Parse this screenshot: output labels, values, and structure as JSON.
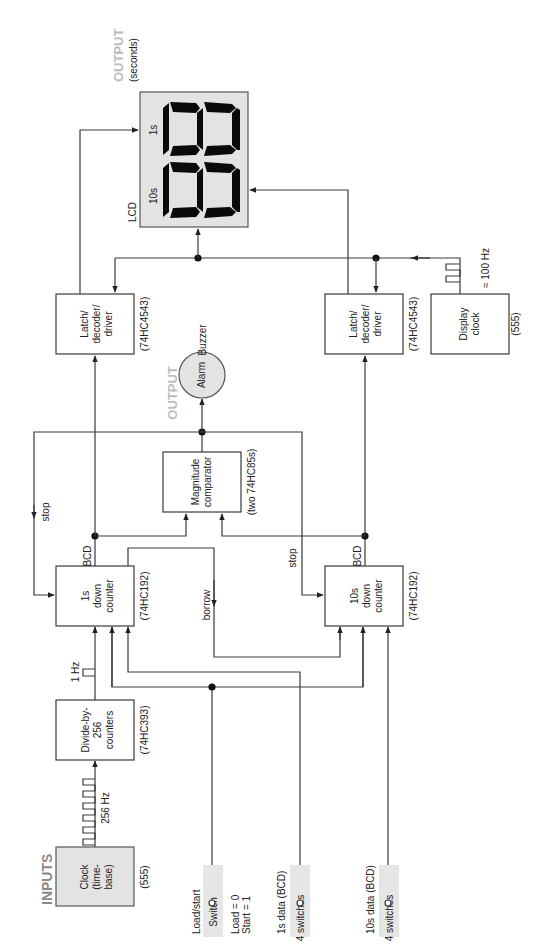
{
  "diagram": {
    "orientation": "rotated 90 degrees counter-clockwise",
    "section_labels": {
      "inputs": "INPUTS",
      "output_display": "OUTPUT",
      "output_display_sub": "(seconds)",
      "output_alarm": "OUTPUT"
    },
    "blocks": {
      "clock": {
        "lines": [
          "Clock",
          "(time-",
          "base)"
        ],
        "part": "(555)"
      },
      "divider": {
        "lines": [
          "Divide-by-",
          "256",
          "counters"
        ],
        "part": "(74HC393)"
      },
      "counter_1s": {
        "lines": [
          "1s",
          "down",
          "counter"
        ],
        "part": "(74HC192)"
      },
      "counter_10s": {
        "lines": [
          "10s",
          "down",
          "counter"
        ],
        "part": "(74HC192)"
      },
      "comparator": {
        "lines": [
          "Magnitude",
          "comparator"
        ],
        "part": "(two 74HC85s)"
      },
      "alarm": {
        "label": "Alarm",
        "sublabel": "Buzzer"
      },
      "latch_1s": {
        "lines": [
          "Latch/",
          "decoder/",
          "driver"
        ],
        "part": "(74HC4543)"
      },
      "latch_10s": {
        "lines": [
          "Latch/",
          "decoder/",
          "driver"
        ],
        "part": "(74HC4543)"
      },
      "display_clock": {
        "lines": [
          "Display",
          "clock"
        ],
        "part": "(555)"
      },
      "lcd": {
        "label": "LCD",
        "digit_10s": "10s",
        "digit_1s": "1s"
      }
    },
    "signals": {
      "clock_freq": "256 Hz",
      "divider_out": "1 Hz",
      "display_freq": "≈ 100 Hz",
      "stop_1s": "stop",
      "stop_10s": "stop",
      "borrow": "borrow",
      "bcd_1s": "BCD",
      "bcd_10s": "BCD"
    },
    "inputs": {
      "load_start": {
        "title": "Load/start",
        "device": "Switch",
        "note1": "Load = 0",
        "note2": "Start = 1"
      },
      "data_1s": {
        "title": "1s data (BCD)",
        "device": "4 switches"
      },
      "data_10s": {
        "title": "10s data (BCD)",
        "device": "4 switches"
      }
    }
  }
}
